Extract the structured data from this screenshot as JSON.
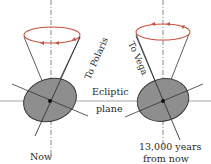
{
  "diagram": {
    "colors": {
      "precession_circle": "#c8503c",
      "earth_fill": "#8e8e8e",
      "earth_stroke": "#3a3a3a",
      "lines": "#333333",
      "ecliptic": "#bdbdbd"
    },
    "labels": {
      "ecliptic_line1": "Ecliptic",
      "ecliptic_line2": "plane",
      "left_axis": "To Polaris",
      "right_axis": "To Vega",
      "left_caption": "Now",
      "right_caption_line1": "13,000 years",
      "right_caption_line2": "from now"
    },
    "panels": [
      {
        "name": "now",
        "pole_star": "Polaris"
      },
      {
        "name": "13000-years-from-now",
        "pole_star": "Vega"
      }
    ]
  }
}
